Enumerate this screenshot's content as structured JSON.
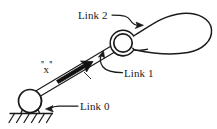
{
  "figure": {
    "kind": "mechanical-linkage-diagram",
    "background_color": "#ffffff",
    "ink_color": "#1a1a1a",
    "width": 217,
    "height": 129
  },
  "labels": {
    "link2": "Link 2",
    "link1": "Link 1",
    "link0": "Link 0",
    "x_quote_open": "''",
    "x_text": "x",
    "x_quote_close": "''"
  },
  "parts": {
    "ground_pivot": "ground-pivot-joint",
    "ground_hatching": "fixed-ground-hatching",
    "link_bar": "link-1-bar",
    "middle_joint": "revolute-joint",
    "body_blob": "link-2-body"
  },
  "leaders": {
    "link2_leader": "s-curve-arrow-to-body",
    "link1_leader": "curve-arrow-to-bar",
    "link0_leader": "straight-arrow-to-ground-pivot",
    "x_arrow": "thick-solid-arrow"
  }
}
